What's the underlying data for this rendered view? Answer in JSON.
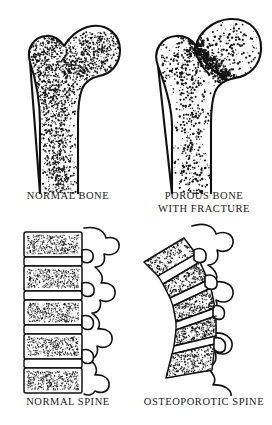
{
  "figure": {
    "background_color": "#ffffff",
    "ink_color": "#111111",
    "style": "pen-and-ink stipple medical illustration",
    "layout": "2 columns x 2 rows comparison plate"
  },
  "panels": [
    {
      "id": "normal-bone",
      "caption": "NORMAL BONE",
      "subject": "proximal femur",
      "condition": "normal",
      "trabecular_density": "dense",
      "has_fracture": false,
      "features": [
        "femoral head",
        "femoral neck",
        "greater trochanter",
        "shaft",
        "dense trabecular stipple"
      ]
    },
    {
      "id": "porous-bone",
      "caption": "POROUS BONE\nWITH FRACTURE",
      "subject": "proximal femur",
      "condition": "osteoporotic",
      "trabecular_density": "sparse, porous",
      "has_fracture": true,
      "fracture_site": "femoral neck",
      "features": [
        "femoral head",
        "fractured femoral neck",
        "greater trochanter",
        "shaft",
        "sparse trabecular stipple"
      ]
    },
    {
      "id": "normal-spine",
      "caption": "NORMAL SPINE",
      "subject": "lumbar vertebral column, lateral view",
      "condition": "normal",
      "vertebra_count": 5,
      "vertebra_shape": "rectangular, uniform height",
      "alignment": "straight",
      "features": [
        "vertebral bodies",
        "intervertebral discs",
        "spinous processes"
      ]
    },
    {
      "id": "osteoporotic-spine",
      "caption": "OSTEOPOROTIC SPINE",
      "subject": "lumbar vertebral column, lateral view",
      "condition": "osteoporotic",
      "vertebra_count": 5,
      "vertebra_shape": "wedged and compressed",
      "alignment": "kyphotic curve",
      "features": [
        "compression fractures",
        "wedged vertebral bodies",
        "narrowed discs",
        "spinous processes"
      ]
    }
  ]
}
